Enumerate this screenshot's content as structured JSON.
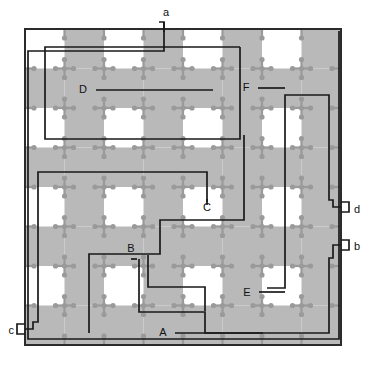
{
  "figure": {
    "type": "layout-diagram",
    "width": 376,
    "height": 369,
    "background": "#ffffff"
  },
  "colors": {
    "shade": "#b9b9b9",
    "cell_marker": "#9a9a9a",
    "wire": "#1a1a1a",
    "border": "#2b2b2b",
    "label_text": "#111111",
    "page_background": "#ffffff"
  },
  "grid": {
    "columns": 8,
    "rows": 8,
    "x0": 25,
    "y0": 29,
    "cell_w": 39.5,
    "cell_h": 39.5,
    "pattern": "checkerboard",
    "marker_shape": "cross-with-end-dots",
    "marker_arm": 9,
    "marker_dot_r": 2.6
  },
  "outer_frame": {
    "x": 25,
    "y": 29,
    "width": 316,
    "height": 316,
    "stroke_width": 2
  },
  "terminals": [
    {
      "id": "a",
      "label": "a",
      "side": "top",
      "text_x": 163,
      "text_y": 16,
      "stub_x": 164,
      "stub_y": 22
    },
    {
      "id": "d",
      "label": "d",
      "side": "right",
      "text_x": 354,
      "text_y": 213,
      "stub_x": 341,
      "stub_y": 207
    },
    {
      "id": "b",
      "label": "b",
      "side": "right",
      "text_x": 354,
      "text_y": 250,
      "stub_x": 341,
      "stub_y": 245
    },
    {
      "id": "c",
      "label": "c",
      "side": "left",
      "text_x": 14,
      "text_y": 334,
      "stub_x": 25,
      "stub_y": 329
    }
  ],
  "net_labels": [
    {
      "id": "A",
      "label": "A",
      "text_x": 163,
      "text_y": 336
    },
    {
      "id": "B",
      "label": "B",
      "text_x": 131,
      "text_y": 252
    },
    {
      "id": "C",
      "label": "C",
      "text_x": 207,
      "text_y": 211
    },
    {
      "id": "D",
      "label": "D",
      "text_x": 83,
      "text_y": 93
    },
    {
      "id": "E",
      "label": "E",
      "text_x": 247,
      "text_y": 296
    },
    {
      "id": "F",
      "label": "F",
      "text_x": 246,
      "text_y": 91
    }
  ],
  "wires": [
    {
      "id": "A",
      "name": "net-a-path",
      "description": "outer perimeter route from terminal a down around the bottom",
      "points": "164,22 164,30 164,51 28,51 28,339 339,339 339,31"
    },
    {
      "id": "B",
      "name": "net-b-path",
      "description": "route entering from right terminal b to lower middle",
      "points": "341,245 333,245 333,258 329,258 329,333 205,333 205,312 139,312 139,259"
    },
    {
      "id": "C",
      "name": "net-c-path",
      "description": "route from left terminal c up and across mid-upper grid",
      "points": "25,329 33,329 33,322 38,322 38,172 207,172 207,202"
    },
    {
      "id": "D",
      "name": "net-d-path",
      "description": "rectangular loop in the upper-left quadrant ending at label D",
      "points": "240,47 45,47 45,139 240,139 240,47"
    },
    {
      "id": "E",
      "name": "net-e-path",
      "description": "route from right terminal d down and left to label E",
      "points": "341,207 333,207 333,200 329,200 329,95 285,95 285,288 267,288"
    },
    {
      "id": "F",
      "name": "net-f-path",
      "description": "stepped route through centre of grid",
      "points": "244,135 244,220 160,220 160,254 89,254 89,333"
    },
    {
      "id": "G",
      "name": "net-g-path",
      "description": "leader and step from label B area out to the right edge of routing",
      "points": "148,255 148,287 205,287 205,311"
    }
  ],
  "leaders": [
    {
      "id": "A-leader",
      "points": "175,333 263,333",
      "for": "A"
    },
    {
      "id": "B-leader",
      "points": "131,259 137,259",
      "for": "B"
    },
    {
      "id": "C-leader",
      "points": "207,205 207,199",
      "for": "C"
    },
    {
      "id": "D-leader",
      "points": "96,90 213,90",
      "for": "D"
    },
    {
      "id": "E-leader",
      "points": "259,292 285,292",
      "for": "E"
    },
    {
      "id": "F-leader",
      "points": "258,88 285,88",
      "for": "F"
    }
  ],
  "shaded_columns": [
    1,
    3,
    5,
    7
  ],
  "shaded_rows": [
    1,
    3,
    5,
    7
  ],
  "legend_note": ""
}
